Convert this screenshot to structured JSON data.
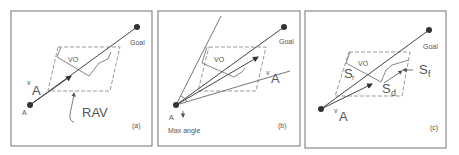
{
  "figure": {
    "panels": [
      {
        "id": "a",
        "tag": "(a)",
        "labels": {
          "start": "A",
          "goal": "Goal",
          "velocity_v": "v",
          "velocity_sub": "A",
          "obstacle": "VO",
          "region": "RAV"
        }
      },
      {
        "id": "b",
        "tag": "(b)",
        "labels": {
          "start": "A",
          "goal": "Goal",
          "velocity_v": "v",
          "velocity_sub": "A",
          "obstacle": "VO",
          "angle": "Max angle"
        }
      },
      {
        "id": "c",
        "tag": "(c)",
        "labels": {
          "start": "",
          "goal": "Goal",
          "velocity_v": "v",
          "velocity_sub": "A",
          "obstacle": "VO",
          "sr": "S",
          "sr_sub": "r",
          "sd": "S",
          "sd_sub": "d",
          "sf": "S",
          "sf_sub": "f"
        }
      }
    ]
  }
}
